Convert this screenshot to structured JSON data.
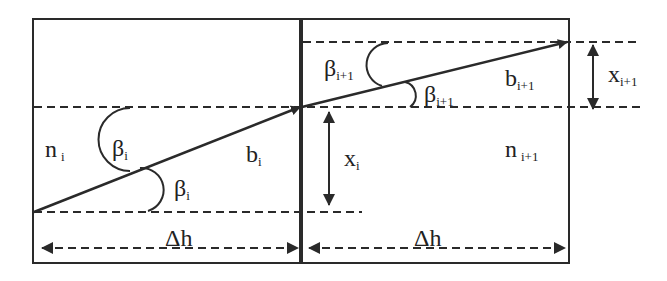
{
  "diagram": {
    "colors": {
      "stroke": "#2a2a2a",
      "background": "#ffffff"
    },
    "left_layer": {
      "refractive_index": {
        "base": "n",
        "sub": "i"
      },
      "ray_label": {
        "base": "b",
        "sub": "i"
      },
      "angle_upper": {
        "base": "β",
        "sub": "i"
      },
      "angle_lower": {
        "base": "β",
        "sub": "i"
      },
      "width_label": "Δh"
    },
    "right_layer": {
      "refractive_index": {
        "base": "n",
        "sub": "i+1"
      },
      "ray_label": {
        "base": "b",
        "sub": "i+1"
      },
      "angle_upper": {
        "base": "β",
        "sub": "i+1"
      },
      "angle_lower": {
        "base": "β",
        "sub": "i+1"
      },
      "width_label": "Δh"
    },
    "offsets": {
      "xi": {
        "base": "x",
        "sub": "i"
      },
      "xi1": {
        "base": "x",
        "sub": "i+1"
      }
    }
  }
}
